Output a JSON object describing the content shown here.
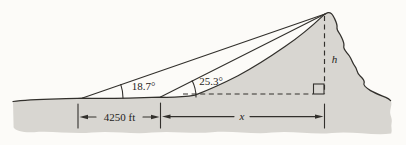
{
  "figure": {
    "type": "trigonometry-surveying-diagram",
    "labels": {
      "near_angle": "18.7°",
      "far_angle": "25.3°",
      "baseline": "4250 ft",
      "horizontal_unknown": "x",
      "height_unknown": "h"
    },
    "colors": {
      "terrain_fill": "#d8d6d1",
      "line": "#32302c",
      "background": "#fcfbf8"
    }
  }
}
